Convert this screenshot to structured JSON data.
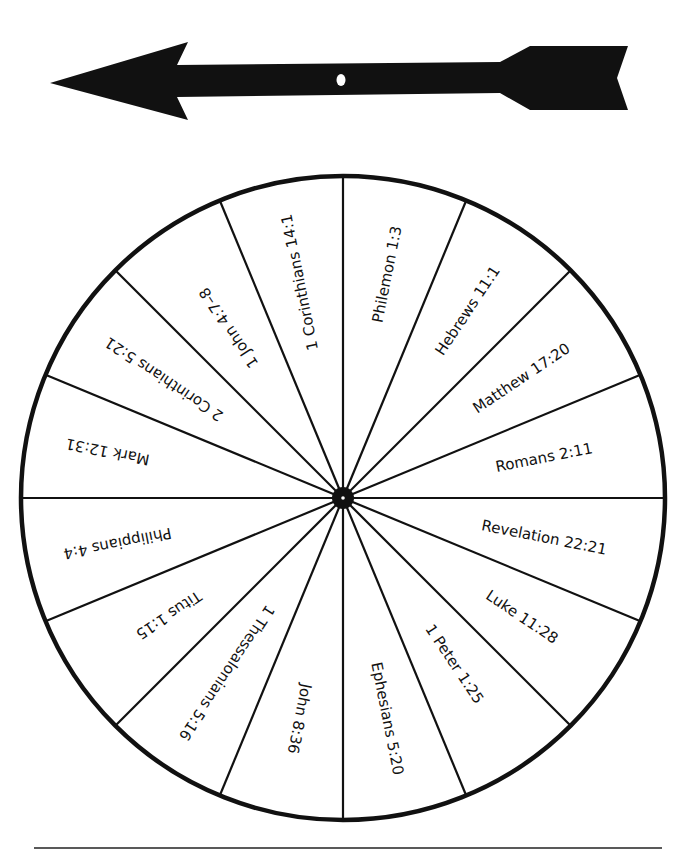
{
  "arrow": {
    "color": "#111111",
    "hole_color": "#ffffff"
  },
  "wheel": {
    "center": [
      343,
      498
    ],
    "radius": 322,
    "segments": 16,
    "stroke_color": "#111111",
    "fill_color": "#ffffff",
    "labels": [
      {
        "text": "Philemon 1:3",
        "radius": 228
      },
      {
        "text": "Hebrews 11:1",
        "radius": 225
      },
      {
        "text": "Matthew 17:20",
        "radius": 215
      },
      {
        "text": "Romans 2:11",
        "radius": 205
      },
      {
        "text": "Revelation 22:21",
        "radius": 205
      },
      {
        "text": "Luke 11:28",
        "radius": 215
      },
      {
        "text": "1 Peter 1:25",
        "radius": 200
      },
      {
        "text": "Ephesians 5:20",
        "radius": 225
      },
      {
        "text": "John 8:36",
        "radius": 225
      },
      {
        "text": "1 Thessalonians 5:16",
        "radius": 210
      },
      {
        "text": "Titus 1:15",
        "radius": 210
      },
      {
        "text": "Philippians 4:4",
        "radius": 230
      },
      {
        "text": "Mark 12:31",
        "radius": 240
      },
      {
        "text": "2 Corinthians 5:21",
        "radius": 215
      },
      {
        "text": "1 John 4:7–8",
        "radius": 205
      },
      {
        "text": "1 Corinthians 14:1",
        "radius": 220
      }
    ]
  },
  "footer_line": {
    "x1": 34,
    "x2": 662,
    "y": 848
  }
}
